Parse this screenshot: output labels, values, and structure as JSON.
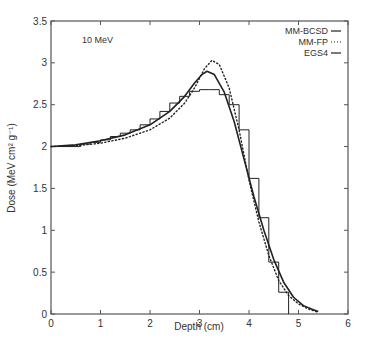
{
  "chart_data": {
    "type": "line",
    "title": "",
    "annotation": "10 MeV",
    "xlabel": "Depth (cm)",
    "ylabel": "Dose (MeV cm² g⁻¹)",
    "xlim": [
      0,
      6
    ],
    "ylim": [
      0,
      3.5
    ],
    "xticks": [
      0,
      1,
      2,
      3,
      4,
      5,
      6
    ],
    "yticks": [
      0,
      0.5,
      1,
      1.5,
      2,
      2.5,
      3,
      3.5
    ],
    "xtick_labels": [
      "0",
      "1",
      "2",
      "3",
      "4",
      "5",
      "6"
    ],
    "ytick_labels": [
      "0",
      "0.5",
      "1",
      "1.5",
      "2",
      "2.5",
      "3",
      "3.5"
    ],
    "grid": false,
    "legend_position": "upper right",
    "series": [
      {
        "name": "MM-BCSD",
        "style": "solid",
        "x": [
          0,
          0.5,
          1.0,
          1.5,
          2.0,
          2.4,
          2.7,
          2.9,
          3.05,
          3.15,
          3.3,
          3.5,
          3.7,
          3.9,
          4.1,
          4.3,
          4.5,
          4.7,
          4.9,
          5.1,
          5.3,
          5.4
        ],
        "y": [
          2.0,
          2.02,
          2.07,
          2.14,
          2.26,
          2.42,
          2.6,
          2.76,
          2.86,
          2.9,
          2.86,
          2.65,
          2.3,
          1.85,
          1.4,
          1.0,
          0.65,
          0.38,
          0.2,
          0.1,
          0.05,
          0.03
        ]
      },
      {
        "name": "MM-FP",
        "style": "dotted",
        "x": [
          0,
          0.5,
          1.0,
          1.5,
          2.0,
          2.4,
          2.7,
          2.9,
          3.1,
          3.25,
          3.4,
          3.6,
          3.8,
          4.0,
          4.2,
          4.4,
          4.6,
          4.8,
          5.0,
          5.2,
          5.4
        ],
        "y": [
          2.0,
          2.01,
          2.04,
          2.1,
          2.2,
          2.34,
          2.52,
          2.7,
          2.93,
          3.03,
          2.98,
          2.7,
          2.2,
          1.6,
          1.1,
          0.7,
          0.4,
          0.22,
          0.12,
          0.06,
          0.02
        ]
      },
      {
        "name": "EGS4",
        "style": "histogram",
        "bin_edges": [
          0,
          0.6,
          0.8,
          1.0,
          1.2,
          1.4,
          1.6,
          1.8,
          2.0,
          2.2,
          2.4,
          2.6,
          2.8,
          3.0,
          3.2,
          3.4,
          3.6,
          3.8,
          4.0,
          4.2,
          4.4,
          4.6,
          4.8
        ],
        "values": [
          2.0,
          2.03,
          2.05,
          2.08,
          2.12,
          2.16,
          2.2,
          2.26,
          2.33,
          2.42,
          2.52,
          2.6,
          2.66,
          2.68,
          2.68,
          2.62,
          2.5,
          2.2,
          1.62,
          1.15,
          0.62,
          0.26
        ]
      }
    ]
  }
}
